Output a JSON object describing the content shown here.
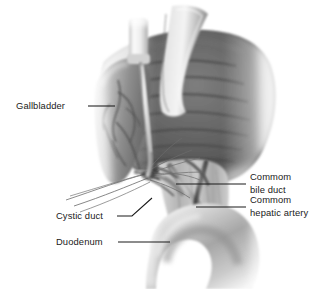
{
  "figure": {
    "background_color": "#ffffff",
    "style": "grayscale medical illustration",
    "labels": [
      {
        "id": "gallbladder",
        "text": "Gallbladder",
        "position": "left",
        "leader": "horizontal"
      },
      {
        "id": "common-bile-duct",
        "text_line1": "Commom",
        "text_line2": "bile duct",
        "position": "right",
        "leader": "horizontal"
      },
      {
        "id": "common-hepatic-artery",
        "text_line1": "Commom",
        "text_line2": "hepatic artery",
        "position": "right",
        "leader": "horizontal"
      },
      {
        "id": "cystic-duct",
        "text": "Cystic duct",
        "position": "lower-left",
        "leader": "angled"
      },
      {
        "id": "duodenum",
        "text": "Duodenum",
        "position": "lower-left",
        "leader": "horizontal"
      }
    ],
    "structures": [
      {
        "id": "liver",
        "name": "liver",
        "tone": "#6a6a6a"
      },
      {
        "id": "gallbladder-body",
        "name": "gallbladder",
        "tone": "#8d8d8d"
      },
      {
        "id": "retractor-band",
        "name": "retractor band",
        "tone": "#cfcfcf"
      },
      {
        "id": "cannula",
        "name": "laparoscopic cannula",
        "tone": "#e6e6e6"
      },
      {
        "id": "duodenum-body",
        "name": "duodenum",
        "tone": "#b9b9b9"
      },
      {
        "id": "bile-duct",
        "name": "common bile duct",
        "tone": "#9a9a9a"
      },
      {
        "id": "hepatic-artery",
        "name": "common hepatic artery",
        "tone": "#5f5f5f"
      },
      {
        "id": "cystic-duct-struct",
        "name": "cystic duct",
        "tone": "#8a8a8a"
      }
    ],
    "colors": {
      "background": "#ffffff",
      "label_text": "#1a1a1a",
      "leader_line": "#1a1a1a",
      "liver_dark": "#4e4e4e",
      "liver_mid": "#6e6e6e",
      "gallbladder": "#909090",
      "duodenum": "#bdbdbd",
      "instrument": "#eaeaea"
    }
  }
}
